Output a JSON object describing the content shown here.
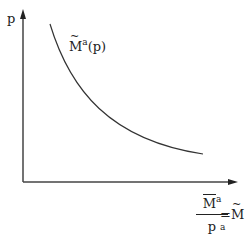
{
  "diagram": {
    "y_axis": {
      "label": "p"
    },
    "x_axis": {
      "label": {
        "numerator_symbol": "M",
        "numerator_superscript": "a",
        "denominator": "p",
        "equals": "=",
        "rhs_symbol": "M",
        "rhs_superscript": "a"
      }
    },
    "curve": {
      "label_symbol": "M",
      "label_superscript": "a",
      "label_arg": "(p)"
    },
    "colors": {
      "stroke": "#222222",
      "background": "#ffffff"
    }
  }
}
